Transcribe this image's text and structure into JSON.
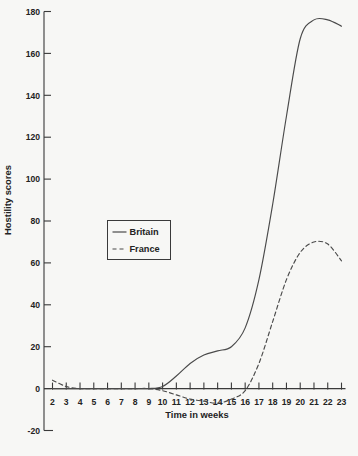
{
  "chart_data": {
    "type": "line",
    "title": "",
    "xlabel": "Time in weeks",
    "ylabel": "Hostility scores",
    "grid": false,
    "legend_position": "center-left",
    "x": [
      2,
      3,
      4,
      5,
      6,
      7,
      8,
      9,
      10,
      11,
      12,
      13,
      14,
      15,
      16,
      17,
      18,
      19,
      20,
      21,
      22,
      23
    ],
    "xlim": [
      2,
      23
    ],
    "ylim": [
      -20,
      180
    ],
    "xticks": [
      "2",
      "3",
      "4",
      "5",
      "6",
      "7",
      "8",
      "9",
      "10",
      "11",
      "12",
      "13",
      "14",
      "15",
      "16",
      "17",
      "18",
      "19",
      "20",
      "21",
      "22",
      "23"
    ],
    "yticks": [
      "-20",
      "0",
      "20",
      "40",
      "60",
      "80",
      "100",
      "120",
      "140",
      "160",
      "180"
    ],
    "ytick_values": [
      -20,
      0,
      20,
      40,
      60,
      80,
      100,
      120,
      140,
      160,
      180
    ],
    "series": [
      {
        "name": "Britain",
        "style": "solid",
        "values": [
          0,
          0,
          0,
          0,
          0,
          0,
          0,
          0,
          1,
          6,
          12,
          16,
          18,
          20,
          29,
          52,
          88,
          130,
          167,
          176,
          176,
          173
        ]
      },
      {
        "name": "France",
        "style": "dashed",
        "values": [
          4,
          1,
          0,
          0,
          0,
          0,
          0,
          0,
          -1,
          -3,
          -5,
          -6,
          -7,
          -5,
          -1,
          12,
          32,
          52,
          65,
          70,
          69,
          61
        ]
      }
    ]
  },
  "legend": {
    "items": [
      {
        "label": "Britain",
        "style": "solid"
      },
      {
        "label": "France",
        "style": "dashed"
      }
    ]
  },
  "axes": {
    "x_axis_title": "Time in weeks",
    "y_axis_title": "Hostility scores"
  }
}
